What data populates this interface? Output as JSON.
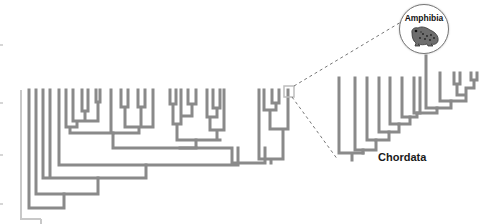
{
  "labels": {
    "zoom_clade": "Amphibia",
    "root_clade": "Chordata"
  },
  "icons": {
    "badge_icon": "frog-icon"
  },
  "colors": {
    "branch": "#8a8a8a",
    "faint_branch": "#c8c8c8",
    "dash": "#777777",
    "highlight_box": "#bdbdbd",
    "text": "#1a1a1a"
  },
  "main_tree": {
    "description": "Large cladogram on left; a small highlighted subclade (boxed) is expanded at right",
    "leaf_top_y": 90,
    "faint_root_path": "M 21 90 L 21 219 L 41 219 M 41 219 L 41 224",
    "paths": [
      "M 29 90 L 29 208 L 64 208 L 64 194 M 64 208 L 64 208",
      "M 36 90 L 36 194 L 98 194 L 98 178",
      "M 43 90 L 43 178 M 50 90 L 50 178 M 43 178 L 146 178 L 146 165",
      "M 59 90 L 59 165 L 238 165 L 238 148",
      "M 66 90 L 66 127 L 77 127 L 77 121 M 73 90 L 73 121 M 82 90 L 82 111 M 88 90 L 88 111 M 82 111 L 88 111 M 85 111 L 85 121 L 73 121 M 73 121 L 77 121 M 96 90 L 96 102 M 100 90 L 100 102 M 96 102 L 100 102 M 98 102 L 98 121 L 77 121 M 70 127 L 70 133 L 113 133 M 111 90 L 111 133",
      "M 121 90 L 121 107 M 128 90 L 128 107 M 121 107 L 128 107 M 125 107 L 125 127 M 138 90 L 138 107 M 145 90 L 145 107 M 138 107 L 145 107 M 141 107 L 141 127 M 125 127 L 153 127 M 153 90 L 153 127 M 139 127 L 139 133 L 113 133 M 113 133 L 113 148 L 196 148",
      "M 170 90 L 170 104 M 176 90 L 176 104 M 170 104 L 176 104 M 173 104 L 173 124 M 188 90 L 188 104 M 196 90 L 196 104 M 188 104 L 196 104 M 192 104 L 192 116 L 181 116 M 181 90 L 181 124 L 173 124 M 177 124 L 177 140 L 220 140 M 207 90 L 207 117 M 213 90 L 213 108 M 220 90 L 220 108 M 213 108 L 220 108 M 217 108 L 217 117 L 207 117 M 224 90 L 224 130 L 210 130 M 210 117 L 210 130 M 217 130 L 217 140",
      "M 196 140 L 196 148 M 180 148 L 232 148 L 232 163 L 265 163 L 265 159 L 265 148",
      "M 259 90 L 259 159 M 264 90 L 264 110 M 272 90 L 272 103 M 279 90 L 279 103 M 272 103 L 279 103 M 276 103 L 276 110 L 264 110 M 270 110 L 270 129 L 283 129 M 288 90 L 288 129 L 283 129 M 283 129 L 283 159 L 259 159 M 271 159 L 271 163"
    ],
    "highlight_box": {
      "x": 284,
      "y": 86,
      "w": 10,
      "h": 11
    }
  },
  "zoom_tree": {
    "description": "Expanded ladder tree of the highlighted subclade; root labeled Chordata, one tip (Amphibia) connects to badge",
    "paths": [
      "M 339 78 L 339 153 L 352 153 M 352 153 L 352 160 M 345 153 L 363 153",
      "M 355 78 L 355 150 L 363 150 L 363 153",
      "M 367 78 L 367 140 L 376 140 L 376 150 L 363 150",
      "M 379 78 L 379 132 L 389 132 L 389 140 L 376 140",
      "M 390 78 L 390 124 L 399 124 L 399 132 L 389 132",
      "M 402 78 L 402 117 L 410 117 L 410 124 L 399 124",
      "M 414 78 L 414 113 M 420 78 L 420 113 M 414 113 L 420 113 M 417 113 L 417 117 L 410 117",
      "M 426 56 L 426 108 L 437 108 L 437 113 L 417 113",
      "M 440 73 L 440 101 L 451 101 L 451 108 L 437 108",
      "M 454 73 L 454 84 M 460 73 L 460 84 M 454 84 L 460 84 M 457 84 L 457 95 L 466 95 M 471 73 L 471 80 M 477 73 L 477 80 M 471 80 L 477 80 M 474 80 L 474 88 L 466 88 L 466 95 M 466 95 L 466 101 L 451 101"
    ]
  },
  "connectors": {
    "dashed_top": "M 294 86 L 401 22",
    "dashed_bottom": "M 292 97 L 338 160"
  },
  "left_ticks_y": [
    44,
    102,
    154,
    203
  ]
}
